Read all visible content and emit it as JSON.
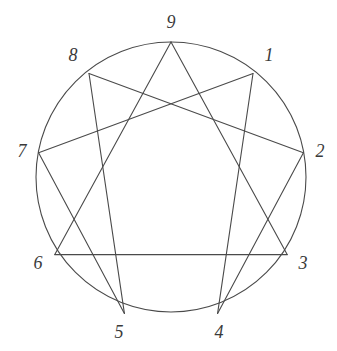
{
  "figure": {
    "name": "enneagram-diagram",
    "background_color": "#ffffff",
    "stroke_color": "#4a4a4a",
    "label_color": "#3a3a3a",
    "stroke_width": 1.1,
    "width": 337,
    "height": 351
  },
  "chart_data": {
    "type": "diagram",
    "subtype": "enneagram",
    "grid": false,
    "legend": null,
    "xlabel": "",
    "ylabel": "",
    "circle": {
      "center_x": 171,
      "center_y": 177,
      "radius": 135,
      "stroke": "#4a4a4a"
    },
    "points": [
      {
        "label": "1",
        "index": 1,
        "x": 253.0,
        "y": 73.5,
        "angle_deg": 40,
        "label_x": 269,
        "label_y": 57
      },
      {
        "label": "2",
        "index": 2,
        "x": 303.4,
        "y": 152.7,
        "angle_deg": 80,
        "label_x": 320,
        "label_y": 153
      },
      {
        "label": "3",
        "index": 3,
        "x": 287.2,
        "y": 254.6,
        "angle_deg": 120,
        "label_x": 303,
        "label_y": 265
      },
      {
        "label": "4",
        "index": 4,
        "x": 217.6,
        "y": 313.4,
        "angle_deg": 160,
        "label_x": 219,
        "label_y": 334
      },
      {
        "label": "5",
        "index": 5,
        "x": 124.4,
        "y": 313.4,
        "angle_deg": 200,
        "label_x": 119,
        "label_y": 334
      },
      {
        "label": "6",
        "index": 6,
        "x": 54.8,
        "y": 254.6,
        "angle_deg": 240,
        "label_x": 38,
        "label_y": 265
      },
      {
        "label": "7",
        "index": 7,
        "x": 38.6,
        "y": 152.7,
        "angle_deg": 280,
        "label_x": 22,
        "label_y": 153
      },
      {
        "label": "8",
        "index": 8,
        "x": 89.0,
        "y": 73.5,
        "angle_deg": 320,
        "label_x": 73,
        "label_y": 57
      },
      {
        "label": "9",
        "index": 9,
        "x": 171.0,
        "y": 42.0,
        "angle_deg": 0,
        "label_x": 171,
        "label_y": 24
      }
    ],
    "triangle": {
      "name": "inner-triangle",
      "vertices": [
        "9",
        "3",
        "6"
      ],
      "edges": [
        [
          "9",
          "3"
        ],
        [
          "3",
          "6"
        ],
        [
          "6",
          "9"
        ]
      ]
    },
    "hexad": {
      "name": "inner-hexad",
      "sequence": [
        "1",
        "4",
        "2",
        "8",
        "5",
        "7"
      ],
      "edges": [
        [
          "1",
          "4"
        ],
        [
          "4",
          "2"
        ],
        [
          "2",
          "8"
        ],
        [
          "8",
          "5"
        ],
        [
          "5",
          "7"
        ],
        [
          "7",
          "1"
        ]
      ]
    }
  }
}
